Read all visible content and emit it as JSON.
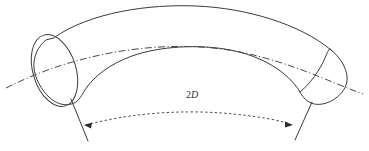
{
  "figure": {
    "background_color": "#ffffff",
    "line_color": "#3a3a3a",
    "text_color": "#2e2e2e",
    "dimension": {
      "value": "2",
      "symbol": "D",
      "full_label": "2D"
    },
    "elements": {
      "tube_label": "bent-tube-body",
      "left_cap_label": "left-end-ellipse",
      "right_cap_label": "right-end-arc",
      "centerline_label": "tube-centerline",
      "dimension_arc_label": "bend-dimension-arc",
      "left_extension_label": "left-extension-line",
      "right_extension_label": "right-extension-line",
      "left_arrow_label": "left-arrowhead",
      "right_arrow_label": "right-arrowhead"
    }
  }
}
